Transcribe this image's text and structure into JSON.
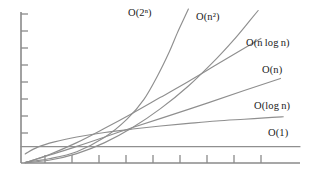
{
  "figure": {
    "title": "",
    "background_color": "#ffffff",
    "curve_color": "#8f8f8f",
    "axis_color": "#8a8a8a",
    "label_color": "#1b1b1b"
  },
  "labels": {
    "exponential": "O(2ⁿ)",
    "quadratic": "O(n²)",
    "linearithmic": "O(n log n)",
    "linear": "O(n)",
    "logarithmic": "O(log n)",
    "constant": "O(1)"
  },
  "chart_data": {
    "type": "line",
    "title": "",
    "xlabel": "",
    "ylabel": "",
    "xlim": [
      0,
      10
    ],
    "ylim": [
      0,
      10
    ],
    "grid": false,
    "legend_position": "inline-right-of-curve-end",
    "x_tick_count": 10,
    "y_tick_count": 9,
    "axis_ticks_labeled": false,
    "x": [
      0,
      0.5,
      1,
      1.5,
      2,
      2.5,
      3,
      3.5,
      4,
      4.5,
      5,
      5.5,
      6,
      6.5,
      7,
      7.5,
      8,
      8.5,
      9,
      9.5,
      10
    ],
    "series": [
      {
        "name": "O(2ⁿ)",
        "label": "O(2ⁿ)",
        "color": "#8f8f8f",
        "x": [
          0.15,
          1.0,
          2.0,
          3.0,
          3.8,
          4.4,
          4.9,
          5.3,
          5.6,
          5.85,
          6.0
        ],
        "values": [
          0.05,
          0.28,
          0.75,
          1.7,
          2.9,
          4.2,
          5.8,
          7.3,
          8.6,
          9.6,
          10.2
        ]
      },
      {
        "name": "O(n²)",
        "label": "O(n²)",
        "color": "#8f8f8f",
        "x": [
          0.15,
          1.0,
          2.0,
          3.0,
          4.0,
          5.0,
          6.0,
          7.0,
          7.6,
          8.1,
          8.5
        ],
        "values": [
          0.02,
          0.18,
          0.62,
          1.35,
          2.35,
          3.6,
          5.1,
          6.9,
          8.1,
          9.2,
          10.1
        ]
      },
      {
        "name": "O(n log n)",
        "label": "O(n log n)",
        "color": "#8f8f8f",
        "x": [
          0.15,
          1.0,
          2.0,
          3.0,
          4.0,
          5.0,
          6.0,
          7.0,
          8.0,
          8.6
        ],
        "values": [
          0.02,
          0.55,
          1.35,
          2.3,
          3.3,
          4.35,
          5.4,
          6.5,
          7.6,
          8.25
        ]
      },
      {
        "name": "O(n)",
        "label": "O(n)",
        "color": "#8f8f8f",
        "x": [
          0.15,
          2.0,
          4.0,
          6.0,
          8.0,
          9.3
        ],
        "values": [
          0.02,
          1.1,
          2.35,
          3.55,
          4.8,
          5.6
        ]
      },
      {
        "name": "O(log n)",
        "label": "O(log n)",
        "color": "#8f8f8f",
        "x": [
          0.15,
          0.6,
          1.2,
          2.0,
          3.0,
          4.0,
          5.0,
          6.0,
          7.0,
          8.0,
          9.0,
          9.4
        ],
        "values": [
          0.6,
          1.05,
          1.4,
          1.72,
          2.02,
          2.25,
          2.45,
          2.62,
          2.78,
          2.9,
          3.02,
          3.06
        ]
      },
      {
        "name": "O(1)",
        "label": "O(1)",
        "color": "#8f8f8f",
        "x": [
          0.0,
          10.0
        ],
        "values": [
          1.08,
          1.08
        ]
      }
    ]
  }
}
